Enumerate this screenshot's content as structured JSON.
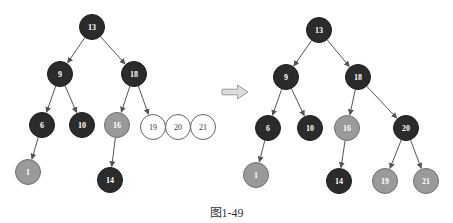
{
  "colors": {
    "black_node": "#2b2b2b",
    "red_node": "#9a9a9a",
    "new_node": "#ffffff",
    "edge": "#555555",
    "arrow_fill": "#dcdcdc",
    "arrow_stroke": "#9a9a9a"
  },
  "caption": "图1-49",
  "left_tree": {
    "nodes": [
      {
        "id": "13",
        "label": "13",
        "x": 92,
        "y": 27,
        "type": "black"
      },
      {
        "id": "9",
        "label": "9",
        "x": 60,
        "y": 74,
        "type": "black"
      },
      {
        "id": "18",
        "label": "18",
        "x": 134,
        "y": 74,
        "type": "black"
      },
      {
        "id": "6",
        "label": "6",
        "x": 42,
        "y": 125,
        "type": "black"
      },
      {
        "id": "10",
        "label": "10",
        "x": 82,
        "y": 125,
        "type": "black"
      },
      {
        "id": "16",
        "label": "16",
        "x": 117,
        "y": 125,
        "type": "red"
      },
      {
        "id": "19",
        "label": "19",
        "x": 153,
        "y": 127,
        "type": "new"
      },
      {
        "id": "20",
        "label": "20",
        "x": 178,
        "y": 127,
        "type": "new"
      },
      {
        "id": "21",
        "label": "21",
        "x": 203,
        "y": 127,
        "type": "new"
      },
      {
        "id": "1",
        "label": "1",
        "x": 28,
        "y": 172,
        "type": "red"
      },
      {
        "id": "14",
        "label": "14",
        "x": 110,
        "y": 180,
        "type": "black"
      }
    ],
    "edges": [
      [
        "13",
        "9"
      ],
      [
        "13",
        "18"
      ],
      [
        "9",
        "6"
      ],
      [
        "9",
        "10"
      ],
      [
        "18",
        "16"
      ],
      [
        "18",
        "19"
      ],
      [
        "6",
        "1"
      ],
      [
        "16",
        "14"
      ]
    ]
  },
  "right_tree": {
    "nodes": [
      {
        "id": "13",
        "label": "13",
        "x": 319,
        "y": 30,
        "type": "black"
      },
      {
        "id": "9",
        "label": "9",
        "x": 286,
        "y": 77,
        "type": "black"
      },
      {
        "id": "18",
        "label": "18",
        "x": 358,
        "y": 77,
        "type": "black"
      },
      {
        "id": "6",
        "label": "6",
        "x": 268,
        "y": 128,
        "type": "black"
      },
      {
        "id": "10",
        "label": "10",
        "x": 310,
        "y": 128,
        "type": "black"
      },
      {
        "id": "16",
        "label": "16",
        "x": 347,
        "y": 128,
        "type": "red"
      },
      {
        "id": "20",
        "label": "20",
        "x": 406,
        "y": 128,
        "type": "black"
      },
      {
        "id": "1",
        "label": "1",
        "x": 256,
        "y": 175,
        "type": "red"
      },
      {
        "id": "14",
        "label": "14",
        "x": 339,
        "y": 181,
        "type": "black"
      },
      {
        "id": "19",
        "label": "19",
        "x": 385,
        "y": 181,
        "type": "red"
      },
      {
        "id": "21",
        "label": "21",
        "x": 426,
        "y": 181,
        "type": "red"
      }
    ],
    "edges": [
      [
        "13",
        "9"
      ],
      [
        "13",
        "18"
      ],
      [
        "9",
        "6"
      ],
      [
        "9",
        "10"
      ],
      [
        "18",
        "16"
      ],
      [
        "18",
        "20"
      ],
      [
        "6",
        "1"
      ],
      [
        "16",
        "14"
      ],
      [
        "20",
        "19"
      ],
      [
        "20",
        "21"
      ]
    ]
  },
  "transform_arrow": {
    "x": 222,
    "y": 92,
    "width": 26,
    "height": 14
  }
}
